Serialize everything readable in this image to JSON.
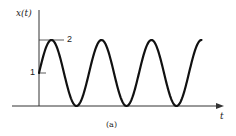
{
  "chart_data": {
    "type": "line",
    "title": "",
    "caption": "(a)",
    "xlabel": "t",
    "ylabel": "x(t)",
    "yticks": [
      {
        "value": 1,
        "label": "1"
      },
      {
        "value": 2,
        "label": "2"
      }
    ],
    "function": "x(t) = 1 + sin(ωt), starting at x=1 at t=0, rising to peak 2",
    "amplitude": 1,
    "offset": 1,
    "ylim": [
      0,
      2
    ],
    "cycles_shown": 3.25,
    "series": [
      {
        "name": "x(t)",
        "description": "sinusoid oscillating between 0 and 2, starting at 1"
      }
    ],
    "grid": false,
    "legend": null
  },
  "labels": {
    "y_axis": "x(t)",
    "x_axis": "t",
    "tick_2": "2",
    "tick_1": "1",
    "caption": "(a)"
  },
  "colors": {
    "curve": "#111111",
    "axis": "#333333",
    "text": "#222222"
  }
}
